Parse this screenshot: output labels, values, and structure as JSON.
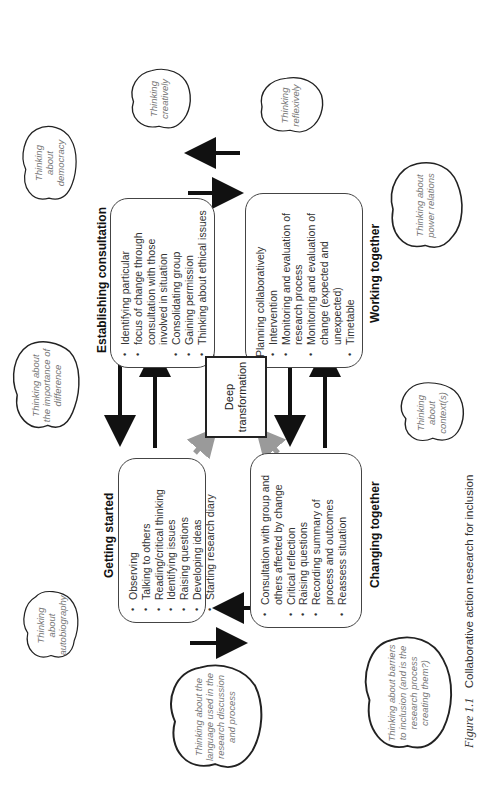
{
  "figure": {
    "caption_label": "Figure 1.1",
    "caption_text": "Collaborative action research for inclusion"
  },
  "stages": {
    "getting_started": {
      "title": "Getting started",
      "items": [
        "Observing",
        "Talking to others",
        "Reading/critical thinking",
        "Identifying issues",
        "Raising questions",
        "Developing ideas",
        "Starting research diary"
      ]
    },
    "establishing_consultation": {
      "title": "Establishing consultation",
      "items": [
        "Identifying particular",
        "focus of change through consultation with those involved in situation",
        "Consolidating group",
        "Gaining permission",
        "Thinking about ethical issues"
      ]
    },
    "working_together": {
      "title": "Working together",
      "lead": "Planning collaboratively",
      "items": [
        "Intervention",
        "Monitoring and evaluation of research process",
        "Monitoring and evaluation of change (expected and unexpected)",
        "Timetable"
      ]
    },
    "changing_together": {
      "title": "Changing together",
      "items": [
        "Consultation with group and others affected by change",
        "Critical reflection",
        "Raising questions",
        "Recording summary of process and outcomes",
        "Reassess situation"
      ]
    }
  },
  "center": {
    "label": "Deep transformation"
  },
  "clouds": {
    "autobiography": "Thinking about autobiography",
    "difference": "Thinking about the importance of difference",
    "democracy": "Thinking about democracy",
    "language": "Thinking about the language used in the research discussion and process",
    "creatively": "Thinking creatively",
    "reflexively": "Thinking reflexively",
    "barriers": "Thinking about barriers to inclusion (and is the research process creating them?)",
    "contexts": "Thinking about context(s)",
    "power": "Thinking about power relations"
  },
  "colors": {
    "arrow_black": "#111111",
    "arrow_grey": "#9a9a9a",
    "box_border": "#444444",
    "cloud_text": "#777777"
  }
}
